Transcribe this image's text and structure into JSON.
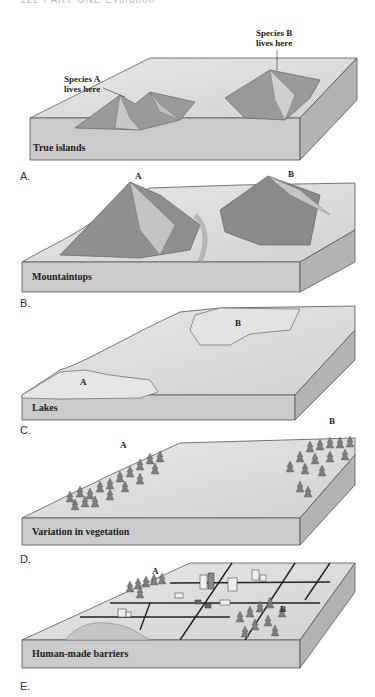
{
  "page_header": "122  PART  ONE  Evolution",
  "panels": [
    {
      "letter": "A.",
      "title": "True islands",
      "labels": {
        "a": "Species A\nlives here",
        "a_line1": "Species A",
        "a_line2": "lives here",
        "b_line1": "Species B",
        "b_line2": "lives here"
      }
    },
    {
      "letter": "B.",
      "title": "Mountaintops",
      "labels": {
        "a": "A",
        "b": "B"
      }
    },
    {
      "letter": "C.",
      "title": "Lakes",
      "labels": {
        "a": "A",
        "b": "B"
      }
    },
    {
      "letter": "D.",
      "title": "Variation in vegetation",
      "labels": {
        "a": "A",
        "b": "B"
      }
    },
    {
      "letter": "E.",
      "title": "Human-made barriers",
      "labels": {
        "a": "A",
        "b": "B"
      }
    }
  ],
  "colors": {
    "slab_top": "#dcdcdc",
    "slab_front": "#c9c9c9",
    "slab_side": "#b5b5b5",
    "outline": "#555555",
    "mountain_dark": "#8a8a8a",
    "mountain_light": "#bdbdbd",
    "tree": "#7a7a7a",
    "road": "#222222"
  }
}
